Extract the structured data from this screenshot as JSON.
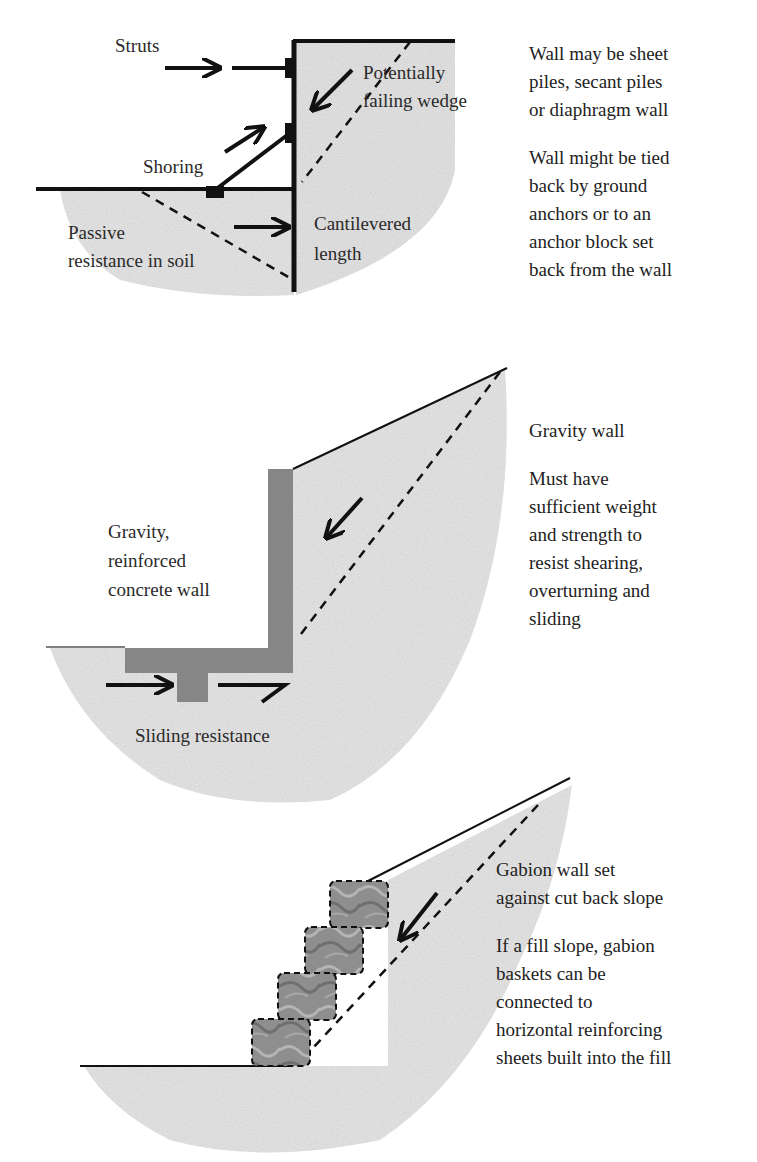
{
  "colors": {
    "soil": "#e6e6e6",
    "concrete": "#8c8c8c",
    "gabion": "#8a8a8a",
    "line": "#111111",
    "text": "#2a2a2a"
  },
  "panel_1": {
    "title": "Embedded / shored wall",
    "labels": {
      "struts": "Struts",
      "shoring": "Shoring",
      "failing_wedge_1": "Potentially",
      "failing_wedge_2": "failing wedge",
      "passive_1": "Passive",
      "passive_2": "resistance in soil",
      "cantilever_1": "Cantilevered",
      "cantilever_2": "length"
    },
    "notes": [
      {
        "lines": [
          "Wall may be sheet",
          "piles, secant piles",
          "or diaphragm wall"
        ]
      },
      {
        "lines": [
          "Wall might be tied",
          "back by ground",
          "anchors or to an",
          "anchor block set",
          "back from the wall"
        ]
      }
    ]
  },
  "panel_2": {
    "labels": {
      "wall_1": "Gravity,",
      "wall_2": "reinforced",
      "wall_3": "concrete wall",
      "sliding": "Sliding resistance"
    },
    "notes": [
      {
        "lines": [
          "Gravity wall"
        ]
      },
      {
        "lines": [
          "Must have",
          "sufficient weight",
          "and strength to",
          "resist shearing,",
          "overturning and",
          "sliding"
        ]
      }
    ]
  },
  "panel_3": {
    "gabion_count": 4,
    "notes": [
      {
        "lines": [
          "Gabion wall set",
          "against cut back slope"
        ]
      },
      {
        "lines": [
          "If a fill slope, gabion",
          "baskets can be",
          "connected to",
          "horizontal reinforcing",
          "sheets built into the fill"
        ]
      }
    ]
  }
}
